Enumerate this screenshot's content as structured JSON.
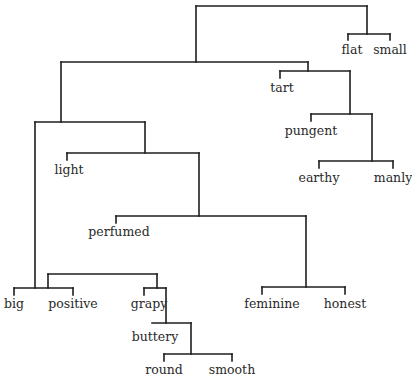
{
  "diagram": {
    "type": "dendrogram",
    "line_color": "#1e1e1e",
    "leaves": [
      {
        "id": "flat",
        "label": "flat",
        "x": 352,
        "y": 43
      },
      {
        "id": "small",
        "label": "small",
        "x": 390,
        "y": 43
      },
      {
        "id": "tart",
        "label": "tart",
        "x": 282,
        "y": 81
      },
      {
        "id": "pungent",
        "label": "pungent",
        "x": 311,
        "y": 124
      },
      {
        "id": "earthy",
        "label": "earthy",
        "x": 319,
        "y": 171
      },
      {
        "id": "manly",
        "label": "manly",
        "x": 393,
        "y": 171
      },
      {
        "id": "light",
        "label": "light",
        "x": 69,
        "y": 163
      },
      {
        "id": "perfumed",
        "label": "perfumed",
        "x": 119,
        "y": 225
      },
      {
        "id": "feminine",
        "label": "feminine",
        "x": 272,
        "y": 297
      },
      {
        "id": "honest",
        "label": "honest",
        "x": 345,
        "y": 297
      },
      {
        "id": "big",
        "label": "big",
        "x": 14,
        "y": 297
      },
      {
        "id": "positive",
        "label": "positive",
        "x": 73,
        "y": 297
      },
      {
        "id": "grapy",
        "label": "grapy",
        "x": 149,
        "y": 297
      },
      {
        "id": "buttery",
        "label": "buttery",
        "x": 155,
        "y": 330
      },
      {
        "id": "round",
        "label": "round",
        "x": 164,
        "y": 363
      },
      {
        "id": "smooth",
        "label": "smooth",
        "x": 232,
        "y": 363
      }
    ],
    "segments": [
      [
        196,
        6,
        367,
        6
      ],
      [
        196,
        6,
        196,
        62
      ],
      [
        367,
        6,
        367,
        34
      ],
      [
        348,
        34,
        390,
        34
      ],
      [
        348,
        34,
        348,
        40
      ],
      [
        390,
        34,
        390,
        40
      ],
      [
        61,
        62,
        308,
        62
      ],
      [
        61,
        62,
        61,
        122
      ],
      [
        308,
        62,
        308,
        71
      ],
      [
        280,
        71,
        350,
        71
      ],
      [
        280,
        71,
        280,
        78
      ],
      [
        350,
        71,
        350,
        114
      ],
      [
        311,
        114,
        372,
        114
      ],
      [
        311,
        114,
        311,
        121
      ],
      [
        372,
        114,
        372,
        161
      ],
      [
        319,
        161,
        393,
        161
      ],
      [
        319,
        161,
        319,
        168
      ],
      [
        393,
        161,
        393,
        168
      ],
      [
        35,
        122,
        145,
        122
      ],
      [
        35,
        122,
        35,
        288
      ],
      [
        145,
        122,
        145,
        153
      ],
      [
        67,
        153,
        199,
        153
      ],
      [
        67,
        153,
        67,
        160
      ],
      [
        199,
        153,
        199,
        216
      ],
      [
        116,
        216,
        306,
        216
      ],
      [
        116,
        216,
        116,
        223
      ],
      [
        306,
        216,
        306,
        287
      ],
      [
        262,
        287,
        345,
        287
      ],
      [
        262,
        287,
        262,
        294
      ],
      [
        345,
        287,
        345,
        294
      ],
      [
        14,
        288,
        73,
        288
      ],
      [
        14,
        288,
        14,
        295
      ],
      [
        73,
        288,
        73,
        295
      ],
      [
        48,
        274,
        157,
        274
      ],
      [
        48,
        274,
        48,
        288
      ],
      [
        157,
        274,
        157,
        288
      ],
      [
        144,
        288,
        166,
        288
      ],
      [
        144,
        288,
        144,
        295
      ],
      [
        166,
        288,
        166,
        323
      ],
      [
        152,
        323,
        191,
        323
      ],
      [
        191,
        323,
        191,
        354
      ],
      [
        164,
        354,
        232,
        354
      ],
      [
        164,
        354,
        164,
        361
      ],
      [
        232,
        354,
        232,
        361
      ]
    ]
  }
}
